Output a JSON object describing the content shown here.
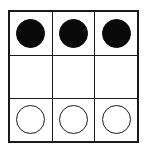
{
  "figure": {
    "rows": 3,
    "columns": 3,
    "border_color": "#1a1a1a",
    "background_color": "#ffffff",
    "filled_color": "#0a0a0a",
    "outline_color": "#1a1a1a"
  },
  "grid": {
    "rows": [
      {
        "row_index": 0,
        "cells": [
          {
            "shape": "circle",
            "fill": "filled",
            "icon": "filled-circle-icon",
            "label": ""
          },
          {
            "shape": "circle",
            "fill": "filled",
            "icon": "filled-circle-icon",
            "label": ""
          },
          {
            "shape": "circle",
            "fill": "filled",
            "icon": "filled-circle-icon",
            "label": ""
          }
        ]
      },
      {
        "row_index": 1,
        "cells": [
          {
            "shape": "none",
            "fill": "none",
            "icon": "empty-cell-icon",
            "label": ""
          },
          {
            "shape": "none",
            "fill": "none",
            "icon": "empty-cell-icon",
            "label": ""
          },
          {
            "shape": "none",
            "fill": "none",
            "icon": "empty-cell-icon",
            "label": ""
          }
        ]
      },
      {
        "row_index": 2,
        "cells": [
          {
            "shape": "circle",
            "fill": "outline",
            "icon": "open-circle-icon",
            "label": ""
          },
          {
            "shape": "circle",
            "fill": "outline",
            "icon": "open-circle-icon",
            "label": ""
          },
          {
            "shape": "circle",
            "fill": "outline",
            "icon": "open-circle-icon",
            "label": ""
          }
        ]
      }
    ]
  }
}
